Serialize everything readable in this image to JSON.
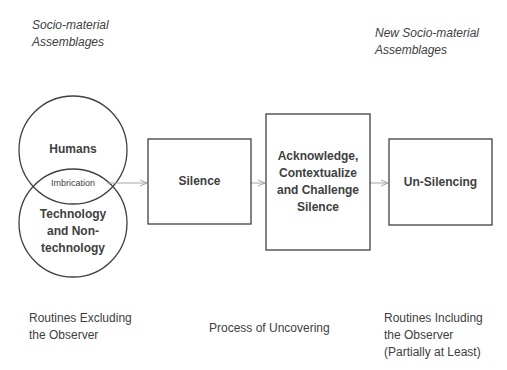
{
  "diagram": {
    "top_labels": {
      "left": [
        "Socio-material",
        "Assemblages"
      ],
      "right": [
        "New Socio-material",
        "Assemblages"
      ]
    },
    "venn": {
      "top_circle": "Humans",
      "bottom_circle": [
        "Technology",
        "and Non-",
        "technology"
      ],
      "overlap": "Imbrication"
    },
    "boxes": [
      {
        "id": "silence",
        "lines": [
          "Silence"
        ]
      },
      {
        "id": "acknowledge",
        "lines": [
          "Acknowledge,",
          "Contextualize",
          "and Challenge",
          "Silence"
        ]
      },
      {
        "id": "un-silencing",
        "lines": [
          "Un-Silencing"
        ]
      }
    ],
    "bottom_labels": {
      "left": [
        "Routines Excluding",
        "the Observer"
      ],
      "center": "Process of Uncovering",
      "right": [
        "Routines Including",
        "the Observer",
        "(Partially at Least)"
      ]
    },
    "colors": {
      "stroke": "#404040",
      "arrow": "#a6a6a6",
      "text": "#404040"
    }
  }
}
